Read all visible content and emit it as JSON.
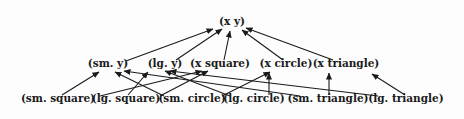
{
  "diagram": {
    "type": "hasse-lattice",
    "levels": [
      {
        "level": "top",
        "nodes": [
          {
            "id": "xy",
            "label": "(x y)"
          }
        ]
      },
      {
        "level": "middle",
        "nodes": [
          {
            "id": "sm_y",
            "label": "(sm. y)"
          },
          {
            "id": "lg_y",
            "label": "(lg. y)"
          },
          {
            "id": "x_square",
            "label": "(x square)"
          },
          {
            "id": "x_circle",
            "label": "(x circle)"
          },
          {
            "id": "x_triangle",
            "label": "(x triangle)"
          }
        ]
      },
      {
        "level": "bottom",
        "nodes": [
          {
            "id": "sm_square",
            "label": "(sm. square)"
          },
          {
            "id": "lg_square",
            "label": "(lg. square)"
          },
          {
            "id": "sm_circle",
            "label": "(sm. circle)"
          },
          {
            "id": "lg_circle",
            "label": "(lg. circle)"
          },
          {
            "id": "sm_triangle",
            "label": "(sm. triangle)"
          },
          {
            "id": "lg_triangle",
            "label": "(lg. triangle)"
          }
        ]
      }
    ],
    "edges": [
      {
        "from": "sm_y",
        "to": "xy"
      },
      {
        "from": "lg_y",
        "to": "xy"
      },
      {
        "from": "x_square",
        "to": "xy"
      },
      {
        "from": "x_circle",
        "to": "xy"
      },
      {
        "from": "x_triangle",
        "to": "xy"
      },
      {
        "from": "sm_square",
        "to": "sm_y"
      },
      {
        "from": "sm_square",
        "to": "x_square"
      },
      {
        "from": "lg_square",
        "to": "lg_y"
      },
      {
        "from": "lg_square",
        "to": "x_square"
      },
      {
        "from": "sm_circle",
        "to": "sm_y"
      },
      {
        "from": "sm_circle",
        "to": "x_circle"
      },
      {
        "from": "lg_circle",
        "to": "lg_y"
      },
      {
        "from": "lg_circle",
        "to": "x_circle"
      },
      {
        "from": "sm_triangle",
        "to": "sm_y"
      },
      {
        "from": "sm_triangle",
        "to": "x_triangle"
      },
      {
        "from": "lg_triangle",
        "to": "lg_y"
      },
      {
        "from": "lg_triangle",
        "to": "x_triangle"
      }
    ]
  }
}
